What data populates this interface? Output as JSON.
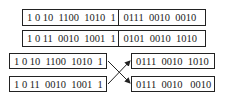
{
  "top_pairs": [
    {
      "left": "1 0 10  1100  1010  1",
      "right": "0111  0010  0010"
    },
    {
      "left": "1 0 11  0010  1001  1",
      "right": "0101  0010  1010"
    }
  ],
  "bottom_left": [
    "1 0 10  1100  1010  1",
    "1 0 11  0010  1001  1"
  ],
  "bottom_right": [
    "0111  0010  1010",
    "0111  0010   0010"
  ],
  "colors": {
    "stroke": "#222222",
    "background": "#ffffff"
  }
}
